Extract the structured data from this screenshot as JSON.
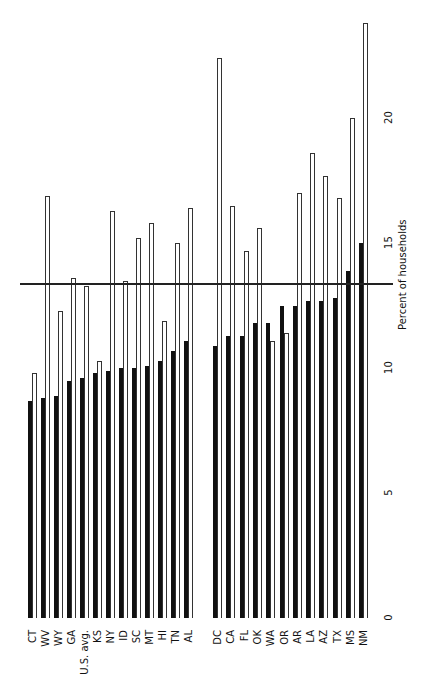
{
  "chart_data": {
    "type": "bar",
    "orientation": "vertical",
    "title": "",
    "xlabel": "",
    "ylabel": "Percent of households",
    "ylim": [
      0,
      24
    ],
    "yticks": [
      0,
      5,
      10,
      15,
      20
    ],
    "grid": false,
    "legend": null,
    "reference_line": {
      "value": 13.4,
      "description": "horizontal line across chart"
    },
    "groups": [
      {
        "categories": [
          "CT",
          "WV",
          "WY",
          "GA",
          "U.S. avg.",
          "KS",
          "NY",
          "ID",
          "SC",
          "MT",
          "HI",
          "TN",
          "AL"
        ]
      },
      {
        "categories": [
          "DC",
          "CA",
          "FL",
          "OK",
          "WA",
          "OR",
          "AR",
          "LA",
          "AZ",
          "TX",
          "MS",
          "NM"
        ]
      }
    ],
    "categories": [
      "CT",
      "WV",
      "WY",
      "GA",
      "U.S. avg.",
      "KS",
      "NY",
      "ID",
      "SC",
      "MT",
      "HI",
      "TN",
      "AL",
      "DC",
      "CA",
      "FL",
      "OK",
      "WA",
      "OR",
      "AR",
      "LA",
      "AZ",
      "TX",
      "MS",
      "NM"
    ],
    "series": [
      {
        "name": "black",
        "color": "#111111",
        "values": [
          8.7,
          8.8,
          8.9,
          9.5,
          9.6,
          9.8,
          9.9,
          10.0,
          10.0,
          10.1,
          10.3,
          10.7,
          11.1,
          10.9,
          11.3,
          11.3,
          11.8,
          11.8,
          12.5,
          12.5,
          12.7,
          12.7,
          12.8,
          13.9,
          15.0
        ]
      },
      {
        "name": "white",
        "color": "#ffffff",
        "values": [
          9.8,
          16.9,
          12.3,
          13.6,
          13.3,
          10.3,
          16.3,
          13.5,
          15.2,
          15.8,
          11.9,
          15.0,
          16.4,
          22.4,
          16.5,
          14.7,
          15.6,
          11.1,
          11.4,
          17.0,
          18.6,
          17.7,
          16.8,
          20.0,
          23.8
        ]
      }
    ]
  }
}
